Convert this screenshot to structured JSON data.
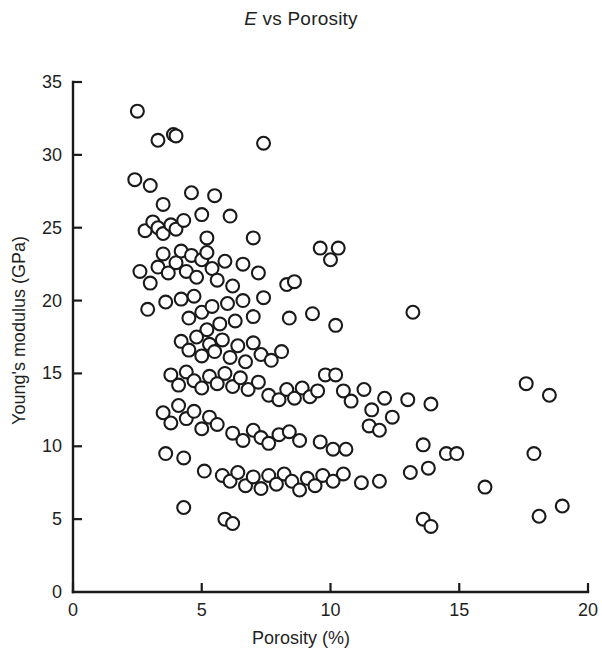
{
  "chart_data": {
    "type": "scatter",
    "title": "E vs Porosity",
    "title_italic_prefix": "E",
    "title_rest": " vs Porosity",
    "xlabel": "Porosity (%)",
    "ylabel": "Young's modulus (GPa)",
    "xlim": [
      0,
      20
    ],
    "ylim": [
      0,
      35
    ],
    "xticks": [
      0,
      5,
      10,
      15,
      20
    ],
    "yticks": [
      0,
      5,
      10,
      15,
      20,
      25,
      30,
      35
    ],
    "xtick_labels": [
      "0",
      "5",
      "10",
      "15",
      "20"
    ],
    "ytick_labels": [
      "0",
      "5",
      "10",
      "15",
      "20",
      "25",
      "30",
      "35"
    ],
    "grid": false,
    "legend": null,
    "marker": {
      "style": "open-circle",
      "facecolor": "#ffffff",
      "edgecolor": "#1a1a1a",
      "size_px": 15,
      "stroke_px": 2.1
    },
    "series": [
      {
        "name": "specimens",
        "points": [
          [
            2.5,
            33.0
          ],
          [
            2.4,
            28.3
          ],
          [
            3.3,
            31.0
          ],
          [
            3.9,
            31.4
          ],
          [
            4.0,
            31.3
          ],
          [
            7.4,
            30.8
          ],
          [
            3.0,
            27.9
          ],
          [
            3.5,
            26.6
          ],
          [
            4.6,
            27.4
          ],
          [
            5.5,
            27.2
          ],
          [
            2.8,
            24.8
          ],
          [
            3.1,
            25.4
          ],
          [
            3.3,
            25.0
          ],
          [
            3.5,
            24.6
          ],
          [
            3.8,
            25.2
          ],
          [
            4.0,
            24.9
          ],
          [
            4.3,
            25.5
          ],
          [
            5.0,
            25.9
          ],
          [
            5.2,
            24.3
          ],
          [
            6.1,
            25.8
          ],
          [
            7.0,
            24.3
          ],
          [
            2.6,
            22.0
          ],
          [
            3.0,
            21.2
          ],
          [
            3.3,
            22.3
          ],
          [
            3.5,
            23.2
          ],
          [
            3.7,
            21.9
          ],
          [
            4.0,
            22.6
          ],
          [
            4.2,
            23.4
          ],
          [
            4.4,
            22.0
          ],
          [
            4.6,
            23.1
          ],
          [
            4.8,
            21.6
          ],
          [
            5.0,
            22.8
          ],
          [
            5.2,
            23.3
          ],
          [
            5.4,
            22.2
          ],
          [
            5.6,
            21.4
          ],
          [
            5.9,
            22.7
          ],
          [
            6.2,
            21.0
          ],
          [
            6.6,
            22.5
          ],
          [
            7.2,
            21.9
          ],
          [
            8.3,
            21.1
          ],
          [
            8.6,
            21.3
          ],
          [
            9.6,
            23.6
          ],
          [
            10.3,
            23.6
          ],
          [
            10.0,
            22.8
          ],
          [
            2.9,
            19.4
          ],
          [
            3.6,
            19.9
          ],
          [
            4.2,
            20.1
          ],
          [
            4.5,
            18.8
          ],
          [
            4.7,
            20.3
          ],
          [
            5.0,
            19.2
          ],
          [
            5.2,
            18.0
          ],
          [
            5.4,
            19.6
          ],
          [
            5.7,
            18.4
          ],
          [
            6.0,
            19.8
          ],
          [
            6.3,
            18.6
          ],
          [
            6.6,
            20.0
          ],
          [
            7.0,
            18.9
          ],
          [
            7.4,
            20.2
          ],
          [
            8.4,
            18.8
          ],
          [
            9.3,
            19.1
          ],
          [
            10.2,
            18.3
          ],
          [
            13.2,
            19.2
          ],
          [
            4.2,
            17.2
          ],
          [
            4.5,
            16.6
          ],
          [
            4.8,
            17.5
          ],
          [
            5.0,
            16.2
          ],
          [
            5.3,
            17.0
          ],
          [
            5.5,
            16.5
          ],
          [
            5.8,
            17.3
          ],
          [
            6.1,
            16.1
          ],
          [
            6.4,
            16.9
          ],
          [
            6.7,
            15.8
          ],
          [
            7.0,
            17.1
          ],
          [
            7.3,
            16.3
          ],
          [
            7.7,
            15.9
          ],
          [
            8.1,
            16.5
          ],
          [
            3.8,
            14.9
          ],
          [
            4.1,
            14.2
          ],
          [
            4.4,
            15.1
          ],
          [
            4.7,
            14.5
          ],
          [
            5.0,
            14.0
          ],
          [
            5.3,
            14.8
          ],
          [
            5.6,
            14.3
          ],
          [
            5.9,
            15.0
          ],
          [
            6.2,
            14.1
          ],
          [
            6.5,
            14.7
          ],
          [
            6.8,
            13.9
          ],
          [
            7.2,
            14.4
          ],
          [
            7.6,
            13.5
          ],
          [
            8.0,
            13.2
          ],
          [
            8.3,
            13.9
          ],
          [
            8.6,
            13.3
          ],
          [
            8.9,
            14.0
          ],
          [
            9.2,
            13.4
          ],
          [
            9.5,
            13.8
          ],
          [
            9.8,
            14.9
          ],
          [
            10.2,
            14.9
          ],
          [
            10.5,
            13.8
          ],
          [
            10.8,
            13.1
          ],
          [
            11.3,
            13.9
          ],
          [
            11.6,
            12.5
          ],
          [
            12.1,
            13.3
          ],
          [
            12.4,
            12.0
          ],
          [
            13.0,
            13.2
          ],
          [
            13.9,
            12.9
          ],
          [
            17.6,
            14.3
          ],
          [
            18.5,
            13.5
          ],
          [
            3.5,
            12.3
          ],
          [
            3.8,
            11.6
          ],
          [
            4.1,
            12.8
          ],
          [
            4.4,
            11.9
          ],
          [
            4.7,
            12.4
          ],
          [
            5.0,
            11.2
          ],
          [
            5.3,
            12.0
          ],
          [
            5.6,
            11.5
          ],
          [
            6.2,
            10.9
          ],
          [
            6.6,
            10.4
          ],
          [
            7.0,
            11.1
          ],
          [
            7.3,
            10.6
          ],
          [
            7.6,
            10.2
          ],
          [
            8.0,
            10.8
          ],
          [
            8.4,
            11.0
          ],
          [
            8.8,
            10.4
          ],
          [
            9.6,
            10.3
          ],
          [
            10.1,
            9.8
          ],
          [
            10.6,
            9.8
          ],
          [
            11.5,
            11.4
          ],
          [
            11.9,
            11.1
          ],
          [
            13.6,
            10.1
          ],
          [
            14.5,
            9.5
          ],
          [
            14.9,
            9.5
          ],
          [
            16.0,
            7.2
          ],
          [
            17.9,
            9.5
          ],
          [
            3.6,
            9.5
          ],
          [
            4.3,
            9.2
          ],
          [
            5.1,
            8.3
          ],
          [
            5.8,
            8.0
          ],
          [
            6.1,
            7.6
          ],
          [
            6.4,
            8.2
          ],
          [
            6.7,
            7.3
          ],
          [
            7.0,
            7.9
          ],
          [
            7.3,
            7.1
          ],
          [
            7.6,
            8.0
          ],
          [
            7.9,
            7.4
          ],
          [
            8.2,
            8.1
          ],
          [
            8.5,
            7.6
          ],
          [
            8.8,
            7.0
          ],
          [
            9.1,
            7.8
          ],
          [
            9.4,
            7.3
          ],
          [
            9.7,
            8.0
          ],
          [
            10.1,
            7.6
          ],
          [
            10.5,
            8.1
          ],
          [
            11.2,
            7.5
          ],
          [
            11.9,
            7.6
          ],
          [
            13.1,
            8.2
          ],
          [
            13.8,
            8.5
          ],
          [
            4.3,
            5.8
          ],
          [
            5.9,
            5.0
          ],
          [
            6.2,
            4.7
          ],
          [
            13.6,
            5.0
          ],
          [
            13.9,
            4.5
          ],
          [
            18.1,
            5.2
          ],
          [
            19.0,
            5.9
          ]
        ]
      }
    ]
  },
  "axes_geometry": {
    "x0_px": 73,
    "x1_px": 588,
    "y0_px": 592,
    "y1_px": 82,
    "tick_len_px": 9
  }
}
